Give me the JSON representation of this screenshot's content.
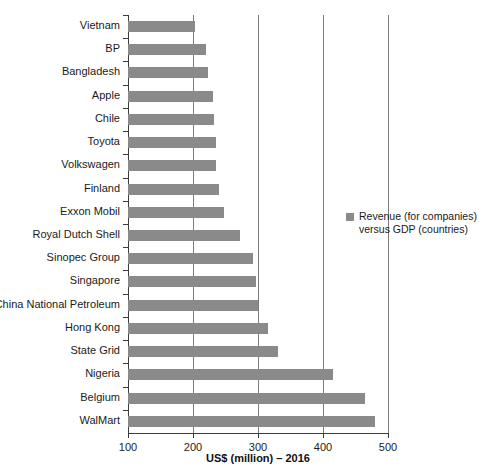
{
  "chart_data": {
    "type": "bar",
    "orientation": "horizontal",
    "title": "",
    "xlabel": "US$ (million) – 2016",
    "ylabel": "",
    "xlim": [
      100,
      500
    ],
    "xticks": [
      "100",
      "200",
      "300",
      "400",
      "500"
    ],
    "grid": true,
    "grid_axis": "x",
    "legend_position": "right",
    "legend": [
      "Revenue (for companies) versus GDP (countries)"
    ],
    "series_color": "#8a8a8a",
    "categories": [
      "Vietnam",
      "BP",
      "Bangladesh",
      "Apple",
      "Chile",
      "Toyota",
      "Volkswagen",
      "Finland",
      "Exxon Mobil",
      "Royal Dutch Shell",
      "Sinopec Group",
      "Singapore",
      "China National Petroleum",
      "Hong Kong",
      "State Grid",
      "Nigeria",
      "Belgium",
      "WalMart"
    ],
    "values": [
      203,
      220,
      223,
      230,
      232,
      235,
      236,
      240,
      248,
      272,
      292,
      297,
      300,
      315,
      330,
      415,
      465,
      480
    ]
  },
  "legend": {
    "label_line1": "Revenue (for companies)",
    "label_line2": "versus GDP (countries)"
  }
}
